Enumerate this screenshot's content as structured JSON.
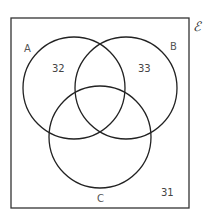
{
  "diagram": {
    "type": "venn",
    "universal_symbol": "ℰ",
    "sets": [
      {
        "name": "A",
        "label": "A"
      },
      {
        "name": "B",
        "label": "B"
      },
      {
        "name": "C",
        "label": "C"
      }
    ],
    "regions": {
      "A_only": "32",
      "B_only": "33",
      "outside": "31"
    },
    "colors": {
      "stroke": "#222222",
      "text": "#555555"
    }
  }
}
